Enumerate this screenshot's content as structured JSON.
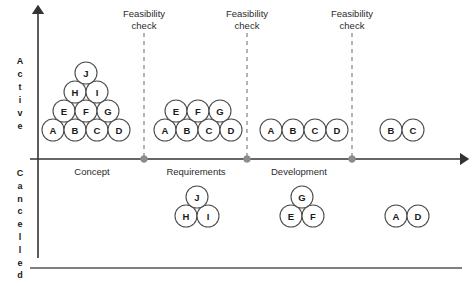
{
  "figure": {
    "axes": {
      "y_axis_upper_label": "Active",
      "y_axis_lower_label": "Cancelled",
      "y_axis_upper_letters": [
        "A",
        "c",
        "t",
        "i",
        "v",
        "e"
      ],
      "y_axis_lower_letters": [
        "C",
        "a",
        "n",
        "c",
        "e",
        "l",
        "l",
        "e",
        "d"
      ],
      "x_axis_arrow": true,
      "y_axis_arrow": true
    },
    "gates": [
      {
        "id": "gate-1",
        "label_line1": "Feasibility",
        "label_line2": "check",
        "x": 144
      },
      {
        "id": "gate-2",
        "label_line1": "Feasibility",
        "label_line2": "check",
        "x": 247
      },
      {
        "id": "gate-3",
        "label_line1": "Feasibility",
        "label_line2": "check",
        "x": 352
      }
    ],
    "phases": [
      {
        "id": "phase-concept",
        "label": "Concept",
        "x": 92
      },
      {
        "id": "phase-requirements",
        "label": "Requirements",
        "x": 196
      },
      {
        "id": "phase-development",
        "label": "Development",
        "x": 299
      }
    ],
    "active_groups": [
      {
        "id": "group-concept-active",
        "rows": [
          {
            "items": [
              "A",
              "B",
              "C",
              "D"
            ],
            "cx_start": 53,
            "cy": 130
          },
          {
            "items": [
              "E",
              "F",
              "G"
            ],
            "cx_start": 64,
            "cy": 111
          },
          {
            "items": [
              "H",
              "I"
            ],
            "cx_start": 75,
            "cy": 92
          },
          {
            "items": [
              "J"
            ],
            "cx_start": 86,
            "cy": 73
          }
        ]
      },
      {
        "id": "group-requirements-active",
        "rows": [
          {
            "items": [
              "A",
              "B",
              "C",
              "D"
            ],
            "cx_start": 165,
            "cy": 130
          },
          {
            "items": [
              "E",
              "F",
              "G"
            ],
            "cx_start": 176,
            "cy": 111
          }
        ]
      },
      {
        "id": "group-development-active",
        "rows": [
          {
            "items": [
              "A",
              "B",
              "C",
              "D"
            ],
            "cx_start": 271,
            "cy": 130
          }
        ]
      },
      {
        "id": "group-post-active",
        "rows": [
          {
            "items": [
              "B",
              "C"
            ],
            "cx_start": 391,
            "cy": 130
          }
        ]
      }
    ],
    "cancelled_groups": [
      {
        "id": "group-requirements-cancelled",
        "rows": [
          {
            "items": [
              "H",
              "I"
            ],
            "cx_start": 186,
            "cy": 216
          },
          {
            "items": [
              "J"
            ],
            "cx_start": 197,
            "cy": 197
          }
        ]
      },
      {
        "id": "group-development-cancelled",
        "rows": [
          {
            "items": [
              "E",
              "F"
            ],
            "cx_start": 291,
            "cy": 216
          },
          {
            "items": [
              "G"
            ],
            "cx_start": 302,
            "cy": 197
          }
        ]
      },
      {
        "id": "group-post-cancelled",
        "rows": [
          {
            "items": [
              "A",
              "D"
            ],
            "cx_start": 396,
            "cy": 216
          }
        ]
      }
    ],
    "geometry": {
      "node_radius": 11,
      "node_spacing": 22,
      "x_axis_y": 159,
      "y_axis_x": 38,
      "y_axis_top": 12,
      "y_axis_bottom": 258,
      "x_axis_left": 30,
      "x_axis_right": 462,
      "frame_top_y": 12,
      "frame_bottom_y": 268,
      "gate_line_top": 33,
      "gate_label_y1": 17,
      "gate_label_y2": 29,
      "phase_label_y": 175
    },
    "colors": {
      "axis": "#333333",
      "frame": "#555555",
      "gate": "#8c8c8c",
      "node_stroke": "#4d4d4d",
      "node_fill": "#ffffff",
      "text": "#2b2b2b",
      "background": "#ffffff"
    }
  }
}
